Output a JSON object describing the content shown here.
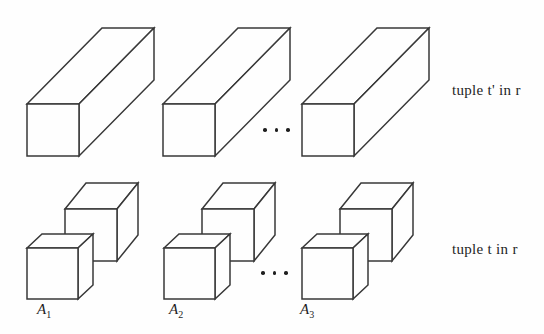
{
  "canvas": {
    "width": 544,
    "height": 334,
    "background": "#fefefe",
    "line_color": "#383838",
    "text_color": "#1f1f1f"
  },
  "top_row": {
    "shape": "elongated-box",
    "box_count": 3,
    "ellipsis_dots": 3,
    "label": "tuple t' in r"
  },
  "bottom_row": {
    "shape": "cube-pair",
    "ellipsis_dots": 3,
    "label": "tuple t in r",
    "attributes": [
      {
        "base": "A",
        "sub": "1"
      },
      {
        "base": "A",
        "sub": "2"
      },
      {
        "base": "A",
        "sub": "3"
      }
    ]
  }
}
